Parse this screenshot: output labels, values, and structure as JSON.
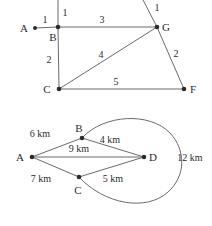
{
  "figures": [
    {
      "id": "top-network-diagram",
      "type": "weighted-graph",
      "nodes": [
        {
          "id": "A",
          "label": "A",
          "x": 35,
          "y": 28,
          "label_x": 24,
          "label_y": 32,
          "dot": true
        },
        {
          "id": "B",
          "label": "B",
          "x": 58,
          "y": 27,
          "label_x": 53,
          "label_y": 41,
          "dot": true
        },
        {
          "id": "C",
          "label": "C",
          "x": 59,
          "y": 89,
          "label_x": 47,
          "label_y": 93,
          "dot": true
        },
        {
          "id": "G",
          "label": "G",
          "x": 157,
          "y": 27,
          "label_x": 164,
          "label_y": 31,
          "dot": true
        },
        {
          "id": "F",
          "label": "F",
          "x": 184,
          "y": 89,
          "label_x": 192,
          "label_y": 93,
          "dot": true
        }
      ],
      "edges": [
        {
          "from": "A",
          "to": "B",
          "weight": "1",
          "label_x": 44,
          "label_y": 23
        },
        {
          "from": "B",
          "to": "G",
          "weight": "3",
          "label_x": 102,
          "label_y": 23
        },
        {
          "from": "B",
          "to": "C",
          "weight": "2",
          "label_x": 49,
          "label_y": 63
        },
        {
          "from": "C",
          "to": "G",
          "weight": "4",
          "label_x": 101,
          "label_y": 58
        },
        {
          "from": "C",
          "to": "F",
          "weight": "5",
          "label_x": 116,
          "label_y": 85
        },
        {
          "from": "G",
          "to": "F",
          "weight": "2",
          "label_x": 175,
          "label_y": 56
        }
      ],
      "open_edges": [
        {
          "id": "B-up",
          "x1": 58,
          "y1": 27,
          "x2": 58,
          "y2": -4,
          "weight": "1",
          "label_x": 63,
          "label_y": 15
        },
        {
          "id": "G-upleft",
          "x1": 157,
          "y1": 27,
          "x2": 141,
          "y2": -4,
          "weight": "1",
          "label_x": 156,
          "label_y": 10
        }
      ]
    },
    {
      "id": "bottom-distance-diagram",
      "type": "weighted-graph-with-arc",
      "nodes": [
        {
          "id": "A",
          "label": "A",
          "x": 32,
          "y": 157,
          "label_x": 19,
          "label_y": 161,
          "dot": true
        },
        {
          "id": "B",
          "label": "B",
          "x": 82,
          "y": 138,
          "label_x": 76,
          "label_y": 131,
          "dot": true
        },
        {
          "id": "C",
          "label": "C",
          "x": 79,
          "y": 177,
          "label_x": 74,
          "label_y": 192,
          "dot": true
        },
        {
          "id": "D",
          "label": "D",
          "x": 144,
          "y": 157,
          "label_x": 151,
          "label_y": 161,
          "dot": true
        }
      ],
      "edges": [
        {
          "from": "A",
          "to": "B",
          "weight": "6 km",
          "label_x": 39,
          "label_y": 136
        },
        {
          "from": "B",
          "to": "D",
          "weight": "4 km",
          "label_x": 106,
          "label_y": 144
        },
        {
          "from": "A",
          "to": "D",
          "weight": "9 km",
          "label_x": 76,
          "label_y": 152
        },
        {
          "from": "A",
          "to": "C",
          "weight": "7 km",
          "label_x": 39,
          "label_y": 180
        },
        {
          "from": "C",
          "to": "D",
          "weight": "5 km",
          "label_x": 110,
          "label_y": 180
        }
      ],
      "arc": {
        "id": "B-to-C-arc",
        "from": "B",
        "to": "C",
        "weight": "12 km",
        "label_x": 172,
        "label_y": 161,
        "path": "M 82 138 C 104 114, 150 112, 170 133 C 186 150, 186 176, 168 192 C 146 212, 104 204, 79 177"
      }
    }
  ],
  "colors": {
    "stroke": "#6b6b6b",
    "node": "#2b2b2b",
    "text": "#2b2b2b",
    "background": "#ffffff"
  }
}
